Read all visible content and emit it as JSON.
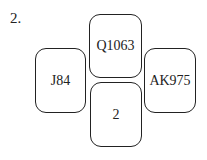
{
  "question": {
    "number_label": "2."
  },
  "boxes": {
    "top": "Q1063",
    "left": "J84",
    "right": "AK975",
    "bottom": "2"
  }
}
